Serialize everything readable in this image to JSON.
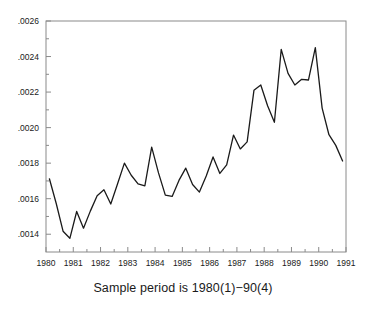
{
  "chart_data": {
    "type": "line",
    "title": "",
    "subtitle": "",
    "caption": "Sample period is 1980(1)−90(4)",
    "xlabel": "",
    "ylabel": "",
    "xlim": [
      1980.0,
      1991.0
    ],
    "ylim": [
      0.0013,
      0.0026
    ],
    "grid": false,
    "legend": null,
    "x_tick_labels": [
      "1980",
      "1981",
      "1982",
      "1983",
      "1984",
      "1985",
      "1986",
      "1987",
      "1988",
      "1989",
      "1990",
      "1991"
    ],
    "x_ticks": [
      1980,
      1981,
      1982,
      1983,
      1984,
      1985,
      1986,
      1987,
      1988,
      1989,
      1990,
      1991
    ],
    "x_minor_ticks": [
      1980.5,
      1981.5,
      1982.5,
      1983.5,
      1984.5,
      1985.5,
      1986.5,
      1987.5,
      1988.5,
      1989.5,
      1990.5
    ],
    "y_tick_labels": [
      ".0014",
      ".0016",
      ".0018",
      ".0020",
      ".0022",
      ".0024",
      ".0026"
    ],
    "y_ticks": [
      0.0014,
      0.0016,
      0.0018,
      0.002,
      0.0022,
      0.0024,
      0.0026
    ],
    "y_minor_ticks": [
      0.0015,
      0.0017,
      0.0019,
      0.0021,
      0.0023,
      0.0025
    ],
    "line_color": "#1a1a1a",
    "line_width": 1.3,
    "frame_color": "#8a8a8a",
    "background": "#ffffff",
    "x": [
      1980.125,
      1980.375,
      1980.625,
      1980.875,
      1981.125,
      1981.375,
      1981.625,
      1981.875,
      1982.125,
      1982.375,
      1982.625,
      1982.875,
      1983.125,
      1983.375,
      1983.625,
      1983.875,
      1984.125,
      1984.375,
      1984.625,
      1984.875,
      1985.125,
      1985.375,
      1985.625,
      1985.875,
      1986.125,
      1986.375,
      1986.625,
      1986.875,
      1987.125,
      1987.375,
      1987.625,
      1987.875,
      1988.125,
      1988.375,
      1988.625,
      1988.875,
      1989.125,
      1989.375,
      1989.625,
      1989.875,
      1990.125,
      1990.375,
      1990.625,
      1990.875
    ],
    "periods": [
      "1980(1)",
      "1980(2)",
      "1980(3)",
      "1980(4)",
      "1981(1)",
      "1981(2)",
      "1981(3)",
      "1981(4)",
      "1982(1)",
      "1982(2)",
      "1982(3)",
      "1982(4)",
      "1983(1)",
      "1983(2)",
      "1983(3)",
      "1983(4)",
      "1984(1)",
      "1984(2)",
      "1984(3)",
      "1984(4)",
      "1985(1)",
      "1985(2)",
      "1985(3)",
      "1985(4)",
      "1986(1)",
      "1986(2)",
      "1986(3)",
      "1986(4)",
      "1987(1)",
      "1987(2)",
      "1987(3)",
      "1987(4)",
      "1988(1)",
      "1988(2)",
      "1988(3)",
      "1988(4)",
      "1989(1)",
      "1989(2)",
      "1989(3)",
      "1989(4)",
      "1990(1)",
      "1990(2)",
      "1990(3)",
      "1990(4)"
    ],
    "values": [
      0.001712,
      0.001573,
      0.001417,
      0.001377,
      0.001528,
      0.001434,
      0.00153,
      0.001617,
      0.00165,
      0.00157,
      0.001684,
      0.0018,
      0.001732,
      0.001683,
      0.001672,
      0.00189,
      0.001745,
      0.00162,
      0.001613,
      0.001703,
      0.001772,
      0.00168,
      0.001637,
      0.001728,
      0.001835,
      0.001742,
      0.00179,
      0.001958,
      0.00188,
      0.00192,
      0.00221,
      0.00224,
      0.002123,
      0.00203,
      0.00244,
      0.002305,
      0.00224,
      0.002272,
      0.002268,
      0.00245,
      0.00211,
      0.00196,
      0.0019,
      0.001812
    ]
  }
}
